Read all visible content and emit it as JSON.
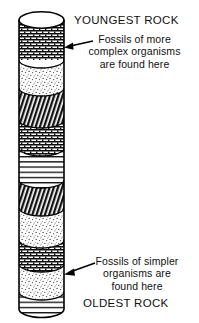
{
  "figure": {
    "title_top": "YOUNGEST ROCK",
    "title_bottom": "OLDEST ROCK",
    "caption_top": "Fossils of more\ncomplex organisms\nare found here",
    "caption_bottom": "Fossils of simpler\norganisms are\nfound here",
    "colors": {
      "ink": "#000000",
      "paper": "#ffffff",
      "stipple": "#f2f2f2",
      "hatch_dark": "#1a1a1a",
      "brick": "#e8e8e8",
      "lines": "#f6f6f6"
    },
    "column": {
      "shape": "rock-strata-cylinder",
      "x": 19,
      "width": 45,
      "top": 12,
      "bottom": 317
    },
    "layers": [
      {
        "name": "cylinder-top-ellipse",
        "pattern": "blank",
        "y": 12,
        "height": 16
      },
      {
        "name": "layer-brick-1",
        "pattern": "brick",
        "y": 28,
        "height": 32
      },
      {
        "name": "layer-stipple-1",
        "pattern": "stipple",
        "y": 60,
        "height": 28
      },
      {
        "name": "layer-hatch-1",
        "pattern": "diagonal-dark",
        "y": 88,
        "height": 32
      },
      {
        "name": "layer-brick-2",
        "pattern": "brick",
        "y": 120,
        "height": 28
      },
      {
        "name": "layer-lines-1",
        "pattern": "horizontal",
        "y": 148,
        "height": 32
      },
      {
        "name": "layer-hatch-2",
        "pattern": "diagonal-dark",
        "y": 180,
        "height": 28
      },
      {
        "name": "layer-stipple-2",
        "pattern": "stipple",
        "y": 208,
        "height": 32
      },
      {
        "name": "layer-brick-3",
        "pattern": "brick",
        "y": 240,
        "height": 24
      },
      {
        "name": "layer-stipple-3",
        "pattern": "stipple",
        "y": 264,
        "height": 28
      },
      {
        "name": "layer-lines-2",
        "pattern": "horizontal",
        "y": 292,
        "height": 25
      }
    ],
    "arrows": [
      {
        "name": "arrow-top",
        "from_x": 92,
        "from_y": 41,
        "to_x": 64,
        "to_y": 47
      },
      {
        "name": "arrow-bottom",
        "from_x": 92,
        "from_y": 263,
        "to_x": 64,
        "to_y": 274
      }
    ]
  }
}
